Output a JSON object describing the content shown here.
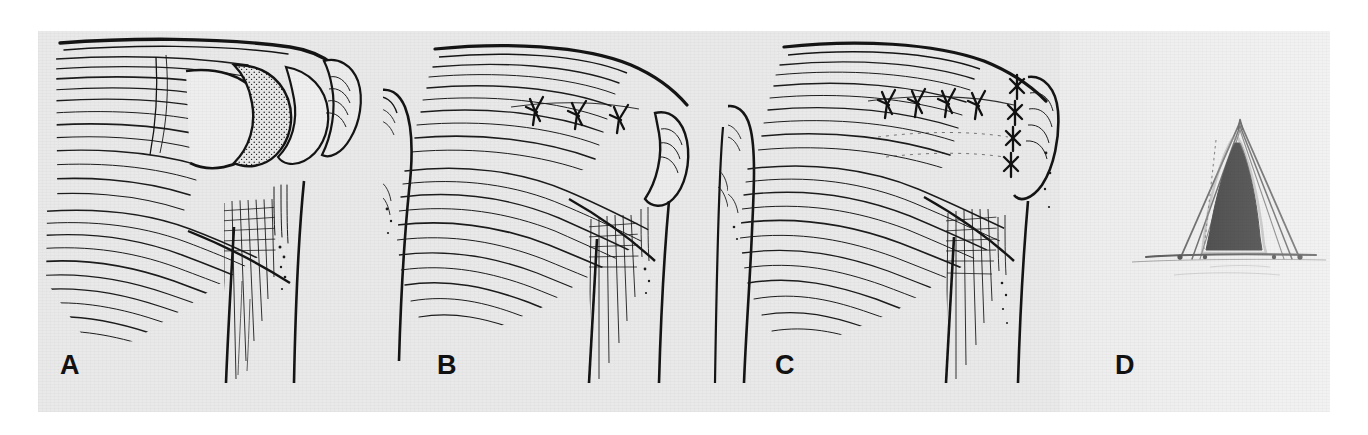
{
  "figure": {
    "kind": "medical-illustration",
    "background_color": "#e9e9e9",
    "ink_color": "#111111",
    "page_color": "#ffffff",
    "panel_count": 4
  },
  "panels": [
    {
      "id": "A",
      "label": "A",
      "label_x": 60,
      "label_y": 352,
      "caption": "Rotator cuff tear with retracted tendon edge exposing the humeral head",
      "features": [
        "supraspinatus muscle belly with parallel fiber hatching",
        "full-thickness tendon defect",
        "stippled exposed humeral head",
        "greater tuberosity",
        "humeral shaft with bicipital groove"
      ],
      "suture_count": 0
    },
    {
      "id": "B",
      "label": "B",
      "label_x": 437,
      "label_y": 352,
      "caption": "Side-to-side closure of the tear with interrupted sutures",
      "features": [
        "approximated tendon margins",
        "three interrupted sutures along the longitudinal split",
        "greater tuberosity",
        "humeral shaft"
      ],
      "suture_count": 3
    },
    {
      "id": "C",
      "label": "C",
      "label_x": 775,
      "label_y": 352,
      "caption": "Completed repair with the tendon reattached to the greater tuberosity",
      "features": [
        "convergent side-to-side sutures",
        "vertical row of sutures at the tuberosity insertion",
        "restored cuff contour",
        "humeral shaft"
      ],
      "suture_count": 8
    },
    {
      "id": "D",
      "label": "D",
      "label_x": 1115,
      "label_y": 352,
      "caption": "Tent analogy: closing the doorway restores tension across the canopy",
      "features": [
        "tent canopy outline",
        "open triangular doorway shown in solid black",
        "ground line with guy pegs"
      ],
      "suture_count": 0
    }
  ],
  "labels": {
    "a": "A",
    "b": "B",
    "c": "C",
    "d": "D"
  }
}
